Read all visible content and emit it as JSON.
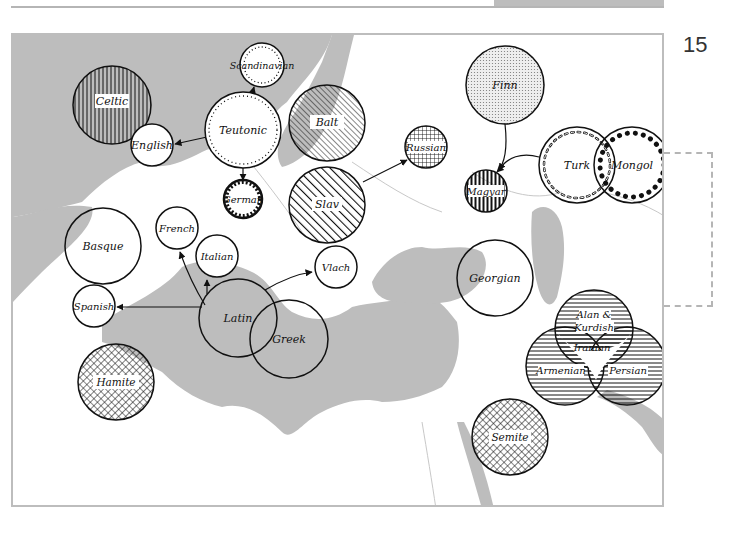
{
  "page": {
    "page_number": "15",
    "colors": {
      "land": "#ffffff",
      "sea": "#bdbdbd",
      "circle_stroke": "#111111",
      "frame": "#bdbdbd"
    }
  },
  "map": {
    "title": "",
    "groups": [
      {
        "id": "celtic",
        "label": "Celtic",
        "pattern": "vertical-lines"
      },
      {
        "id": "english",
        "label": "English",
        "pattern": "none"
      },
      {
        "id": "scandinavian",
        "label": "Scandinavian",
        "pattern": "dotted-ring"
      },
      {
        "id": "teutonic",
        "label": "Teutonic",
        "pattern": "dotted-ring"
      },
      {
        "id": "german",
        "label": "German",
        "pattern": "gear-ring"
      },
      {
        "id": "balt",
        "label": "Balt",
        "pattern": "fine-diagonal"
      },
      {
        "id": "slav",
        "label": "Slav",
        "pattern": "bold-diagonal"
      },
      {
        "id": "russian",
        "label": "Russian",
        "pattern": "grid"
      },
      {
        "id": "finn",
        "label": "Finn",
        "pattern": "stipple"
      },
      {
        "id": "magyar",
        "label": "Magyar",
        "pattern": "vertical-bold"
      },
      {
        "id": "turk",
        "label": "Turk",
        "pattern": "open-circle-ring"
      },
      {
        "id": "mongol",
        "label": "Mongol",
        "pattern": "filled-dot-ring"
      },
      {
        "id": "basque",
        "label": "Basque",
        "pattern": "none"
      },
      {
        "id": "french",
        "label": "French",
        "pattern": "none"
      },
      {
        "id": "italian",
        "label": "Italian",
        "pattern": "none"
      },
      {
        "id": "vlach",
        "label": "Vlach",
        "pattern": "none"
      },
      {
        "id": "spanish",
        "label": "Spanish",
        "pattern": "none"
      },
      {
        "id": "latin",
        "label": "Latin",
        "pattern": "none"
      },
      {
        "id": "greek",
        "label": "Greek",
        "pattern": "none"
      },
      {
        "id": "georgian",
        "label": "Georgian",
        "pattern": "none"
      },
      {
        "id": "alan_kurdish",
        "label_line1": "Alan &",
        "label_line2": "Kurdish",
        "pattern": "horizontal-lines"
      },
      {
        "id": "iranian",
        "label": "Iranian",
        "pattern": "none"
      },
      {
        "id": "armenian",
        "label": "Armenian",
        "pattern": "horizontal-lines"
      },
      {
        "id": "persian",
        "label": "Persian",
        "pattern": "horizontal-lines"
      },
      {
        "id": "hamite",
        "label": "Hamite",
        "pattern": "crosshatch"
      },
      {
        "id": "semite",
        "label": "Semite",
        "pattern": "crosshatch"
      }
    ],
    "arrows": [
      {
        "from": "Teutonic",
        "to": "English"
      },
      {
        "from": "Teutonic",
        "to": "Scandinavian"
      },
      {
        "from": "Teutonic",
        "to": "German"
      },
      {
        "from": "Slav",
        "to": "Russian"
      },
      {
        "from": "Finn",
        "to": "Magyar"
      },
      {
        "from": "Turk",
        "to": "Magyar"
      },
      {
        "from": "Latin",
        "to": "French"
      },
      {
        "from": "Latin",
        "to": "Italian"
      },
      {
        "from": "Latin",
        "to": "Spanish"
      },
      {
        "from": "Latin",
        "to": "Vlach"
      }
    ]
  }
}
